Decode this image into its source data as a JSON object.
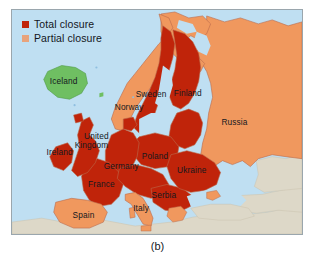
{
  "figure": {
    "caption": "(b)",
    "type": "choropleth-map",
    "region": "Europe"
  },
  "legend": {
    "items": [
      {
        "label": "Total closure",
        "color": "#c0240a",
        "key": "total"
      },
      {
        "label": "Partial closure",
        "color": "#e8a37c",
        "key": "partial"
      }
    ]
  },
  "colors": {
    "sea": "#bfdff2",
    "total_closure": "#c0240a",
    "partial_closure": "#f0985e",
    "open": "#6fbf62",
    "outside_scope": "#ddd8c8",
    "border": "#b96a4c",
    "frame": "#9aa6ad",
    "label_text": "#15181e"
  },
  "map": {
    "labels": [
      {
        "name": "Iceland",
        "text": "Iceland",
        "x": 52,
        "y": 75,
        "status": "open"
      },
      {
        "name": "Norway",
        "text": "Norway",
        "x": 118,
        "y": 101,
        "status": "partial"
      },
      {
        "name": "Sweden",
        "text": "Sweden",
        "x": 140,
        "y": 88,
        "status": "total"
      },
      {
        "name": "Finland",
        "text": "Finland",
        "x": 177,
        "y": 87,
        "status": "total"
      },
      {
        "name": "Russia",
        "text": "Russia",
        "x": 224,
        "y": 116,
        "status": "partial"
      },
      {
        "name": "United Kingdom",
        "text": "United",
        "x": 85,
        "y": 130,
        "status": "total"
      },
      {
        "name": "United Kingdom",
        "text": "Kingdom",
        "x": 80,
        "y": 139,
        "status": "total"
      },
      {
        "name": "Ireland",
        "text": "Ireland",
        "x": 48,
        "y": 146,
        "status": "total"
      },
      {
        "name": "Poland",
        "text": "Poland",
        "x": 144,
        "y": 150,
        "status": "total"
      },
      {
        "name": "Germany",
        "text": "Germany",
        "x": 110,
        "y": 160,
        "status": "total"
      },
      {
        "name": "Ukraine",
        "text": "Ukraine",
        "x": 181,
        "y": 164,
        "status": "total"
      },
      {
        "name": "France",
        "text": "France",
        "x": 90,
        "y": 179,
        "status": "total"
      },
      {
        "name": "Serbia",
        "text": "Serbia",
        "x": 153,
        "y": 190,
        "status": "total"
      },
      {
        "name": "Italy",
        "text": "Italy",
        "x": 130,
        "y": 203,
        "status": "partial"
      },
      {
        "name": "Spain",
        "text": "Spain",
        "x": 72,
        "y": 210,
        "status": "partial"
      }
    ],
    "statuses": {
      "total_closure": [
        "United Kingdom",
        "Ireland",
        "France",
        "Germany",
        "Poland",
        "Ukraine",
        "Sweden",
        "Finland",
        "Serbia",
        "Belgium",
        "Netherlands",
        "Denmark",
        "Czechia",
        "Slovakia",
        "Austria",
        "Switzerland",
        "Hungary",
        "Romania",
        "Bulgaria",
        "Baltic states"
      ],
      "partial_closure": [
        "Russia",
        "Norway",
        "Spain",
        "Italy",
        "Portugal",
        "Greece",
        "Turkey",
        "Belarus",
        "Ukraine coast"
      ],
      "open": [
        "Iceland"
      ]
    }
  }
}
